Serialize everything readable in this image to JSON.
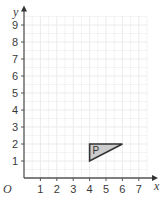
{
  "chart_data": {
    "type": "scatter",
    "title": "",
    "xlabel": "x",
    "ylabel": "y",
    "origin_label": "O",
    "xlim": [
      0,
      7.5
    ],
    "ylim": [
      0,
      9.5
    ],
    "grid": true,
    "x_ticks": [
      "1",
      "2",
      "3",
      "4",
      "5",
      "6",
      "7"
    ],
    "y_ticks": [
      "1",
      "2",
      "3",
      "4",
      "5",
      "6",
      "7",
      "8",
      "9"
    ],
    "shapes": [
      {
        "name": "P",
        "type": "triangle",
        "vertices": [
          [
            4,
            1
          ],
          [
            4,
            2
          ],
          [
            6,
            2
          ]
        ],
        "fill": "#cccccc",
        "stroke": "#333333"
      }
    ]
  },
  "colors": {
    "grid": "#ebebeb",
    "axis": "#555555"
  }
}
